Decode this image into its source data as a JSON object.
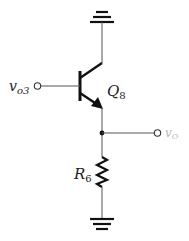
{
  "diagram": {
    "type": "circuit-schematic",
    "colors": {
      "wire": "#444444",
      "component": "#111111",
      "output_label": "#b8b8b8"
    },
    "labels": {
      "input": {
        "main": "v",
        "sub": "o3"
      },
      "transistor": {
        "main": "Q",
        "sub": "8"
      },
      "resistor": {
        "main": "R",
        "sub": "6"
      },
      "output": {
        "main": "v",
        "sub": "O"
      }
    },
    "components": [
      {
        "id": "gnd-top",
        "kind": "ground",
        "connects_to": "Q8 collector"
      },
      {
        "id": "Q8",
        "kind": "npn-bjt",
        "base": "v_o3",
        "collector": "ground (top)",
        "emitter": "output node"
      },
      {
        "id": "R6",
        "kind": "resistor",
        "between": [
          "output node",
          "ground (bottom)"
        ]
      },
      {
        "id": "gnd-bottom",
        "kind": "ground",
        "connects_to": "R6"
      }
    ],
    "terminals": [
      "v_o3 (input)",
      "v_O (output)"
    ]
  }
}
